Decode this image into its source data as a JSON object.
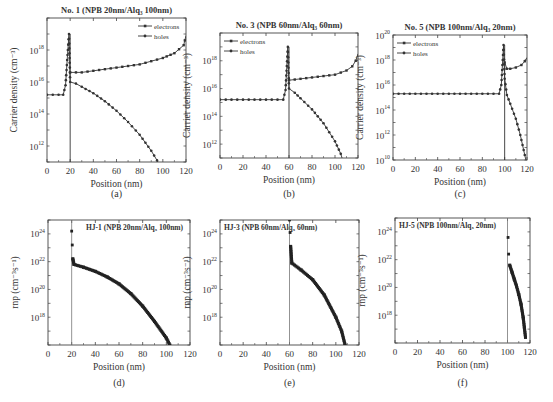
{
  "figure": {
    "panels": [
      {
        "id": "a",
        "caption": "(a)",
        "title": "No. 1 (NPB 20nm/Alq₃ 100nm)",
        "ylabel": "Carrier density (cm⁻³)",
        "xlabel": "Position (nm)"
      },
      {
        "id": "b",
        "caption": "(b)",
        "title": "No. 3 (NPB 60nm/Alq₃ 60nm)",
        "ylabel": "Carrier density (cm⁻³)",
        "xlabel": "Position (nm)"
      },
      {
        "id": "c",
        "caption": "(c)",
        "title": "No. 5 (NPB 100nm/Alq₃ 20nm)",
        "ylabel": "Carrier density (cm⁻³)",
        "xlabel": "Position (nm)"
      },
      {
        "id": "d",
        "caption": "(d)",
        "title": "HJ-1 (NPB 20nm/Alq₃ 100nm)",
        "ylabel": "rnp (cm⁻³s⁻¹)",
        "xlabel": "Position (nm)"
      },
      {
        "id": "e",
        "caption": "(e)",
        "title": "HJ-3 (NPB 60nm/Alq₃ 60nm)",
        "ylabel": "rnp (cm⁻³s⁻¹)",
        "xlabel": "Position (nm)"
      },
      {
        "id": "f",
        "caption": "(f)",
        "title": "HJ-5 (NPB 100nm/Alq₃ 20nm)",
        "ylabel": "rnp (cm⁻³s⁻¹)",
        "xlabel": "Position (nm)"
      }
    ],
    "legend": {
      "electrons": "electrons",
      "holes": "holes"
    }
  },
  "chart_data": [
    {
      "type": "line",
      "panel": "a",
      "title": "No. 1 (NPB 20nm/Alq3 100nm)",
      "xlabel": "Position (nm)",
      "ylabel": "Carrier density (cm^-3)",
      "yscale": "log",
      "xlim": [
        0,
        120
      ],
      "ylim": [
        100000000000.0,
        1e+20
      ],
      "xticks": [
        0,
        20,
        40,
        60,
        80,
        100,
        120
      ],
      "yticks": [
        "10^12",
        "10^14",
        "10^16",
        "10^18"
      ],
      "legend": [
        "electrons",
        "holes"
      ],
      "legend_position": "upper right",
      "series": [
        {
          "name": "electrons",
          "x": [
            20,
            30,
            40,
            50,
            60,
            70,
            80,
            90,
            100,
            110,
            118,
            120
          ],
          "log10_y": [
            16.6,
            16.6,
            16.7,
            16.8,
            16.9,
            17.0,
            17.1,
            17.3,
            17.5,
            17.8,
            18.3,
            18.9
          ]
        },
        {
          "name": "holes",
          "x": [
            0,
            5,
            10,
            14,
            16,
            18,
            19,
            20,
            25,
            30,
            40,
            50,
            60,
            70,
            80,
            90,
            95,
            100
          ],
          "log10_y": [
            15.2,
            15.2,
            15.2,
            15.2,
            15.8,
            18.0,
            19.0,
            16.0,
            15.9,
            15.7,
            15.3,
            14.8,
            14.2,
            13.5,
            12.7,
            11.7,
            11.1,
            10.5
          ]
        }
      ]
    },
    {
      "type": "line",
      "panel": "b",
      "title": "No. 3 (NPB 60nm/Alq3 60nm)",
      "xlabel": "Position (nm)",
      "ylabel": "Carrier density (cm^-3)",
      "yscale": "log",
      "xlim": [
        0,
        120
      ],
      "ylim": [
        100000000000.0,
        1e+20
      ],
      "xticks": [
        0,
        20,
        40,
        60,
        80,
        100,
        120
      ],
      "yticks": [
        "10^12",
        "10^14",
        "10^16",
        "10^18"
      ],
      "legend": [
        "electrons",
        "holes"
      ],
      "legend_position": "upper left",
      "series": [
        {
          "name": "electrons",
          "x": [
            60,
            70,
            80,
            90,
            100,
            110,
            115,
            118,
            120
          ],
          "log10_y": [
            16.6,
            16.7,
            16.8,
            16.9,
            17.0,
            17.3,
            17.6,
            18.0,
            18.5
          ]
        },
        {
          "name": "holes",
          "x": [
            0,
            10,
            20,
            30,
            40,
            50,
            55,
            57,
            59,
            60,
            65,
            70,
            80,
            90,
            100,
            105,
            108
          ],
          "log10_y": [
            15.2,
            15.2,
            15.2,
            15.2,
            15.2,
            15.2,
            15.2,
            15.9,
            19.0,
            16.0,
            15.7,
            15.3,
            14.5,
            13.5,
            12.2,
            11.3,
            10.5
          ]
        }
      ]
    },
    {
      "type": "line",
      "panel": "c",
      "title": "No. 5 (NPB 100nm/Alq3 20nm)",
      "xlabel": "Position (nm)",
      "ylabel": "Carrier density (cm^-3)",
      "yscale": "log",
      "xlim": [
        0,
        120
      ],
      "ylim": [
        10000000000.0,
        1e+20
      ],
      "xticks": [
        0,
        20,
        40,
        60,
        80,
        100,
        120
      ],
      "yticks": [
        "10^10",
        "10^12",
        "10^14",
        "10^16",
        "10^18",
        "10^20"
      ],
      "legend": [
        "electrons",
        "holes"
      ],
      "legend_position": "upper left",
      "series": [
        {
          "name": "electrons",
          "x": [
            100,
            102,
            105,
            110,
            115,
            118,
            120
          ],
          "log10_y": [
            17.8,
            17.3,
            17.3,
            17.4,
            17.6,
            17.9,
            18.2
          ]
        },
        {
          "name": "holes",
          "x": [
            0,
            20,
            40,
            60,
            80,
            95,
            97,
            99,
            100,
            102,
            105,
            110,
            114,
            117,
            119
          ],
          "log10_y": [
            15.3,
            15.3,
            15.3,
            15.3,
            15.3,
            15.3,
            16.0,
            19.2,
            16.5,
            15.2,
            14.5,
            13.3,
            12.0,
            10.8,
            10.0
          ]
        }
      ]
    },
    {
      "type": "scatter",
      "panel": "d",
      "title": "HJ-1 (NPB 20nm/Alq3 100nm)",
      "xlabel": "Position (nm)",
      "ylabel": "rnp (cm^-3 s^-1)",
      "yscale": "log",
      "xlim": [
        0,
        120
      ],
      "ylim": [
        1e+16,
        1e+25
      ],
      "xticks": [
        0,
        20,
        40,
        60,
        80,
        100,
        120
      ],
      "yticks": [
        "10^18",
        "10^20",
        "10^22",
        "10^24"
      ],
      "vline_x": 20,
      "series": [
        {
          "name": "rnp",
          "x": [
            20,
            20.5,
            21,
            22,
            30,
            40,
            50,
            60,
            70,
            80,
            90,
            100,
            103
          ],
          "log10_y": [
            24.2,
            23.2,
            22.2,
            21.8,
            21.6,
            21.3,
            20.9,
            20.4,
            19.7,
            18.8,
            17.7,
            16.5,
            16.0
          ]
        }
      ]
    },
    {
      "type": "scatter",
      "panel": "e",
      "title": "HJ-3 (NPB 60nm/Alq3 60nm)",
      "xlabel": "Position (nm)",
      "ylabel": "rnp (cm^-3 s^-1)",
      "yscale": "log",
      "xlim": [
        0,
        120
      ],
      "ylim": [
        1e+16,
        1e+25
      ],
      "xticks": [
        0,
        20,
        40,
        60,
        80,
        100,
        120
      ],
      "yticks": [
        "10^18",
        "10^20",
        "10^22",
        "10^24"
      ],
      "vline_x": 60,
      "series": [
        {
          "name": "rnp",
          "x": [
            60,
            60.5,
            61,
            62,
            70,
            80,
            90,
            100,
            105,
            108
          ],
          "log10_y": [
            25.0,
            24.1,
            23.1,
            21.9,
            21.4,
            20.7,
            19.6,
            18.0,
            17.0,
            16.0
          ]
        }
      ]
    },
    {
      "type": "scatter",
      "panel": "f",
      "title": "HJ-5 (NPB 100nm/Alq3 20nm)",
      "xlabel": "Position (nm)",
      "ylabel": "rnp (cm^-3 s^-1)",
      "yscale": "log",
      "xlim": [
        0,
        120
      ],
      "ylim": [
        1e+16,
        1e+25
      ],
      "xticks": [
        0,
        20,
        40,
        60,
        80,
        100,
        120
      ],
      "yticks": [
        "10^18",
        "10^20",
        "10^22",
        "10^24"
      ],
      "vline_x": 100,
      "series": [
        {
          "name": "rnp",
          "x": [
            100.5,
            101,
            102,
            104,
            106,
            108,
            110,
            112,
            114,
            115,
            116
          ],
          "log10_y": [
            23.6,
            22.4,
            21.6,
            21.1,
            20.6,
            20.1,
            19.5,
            18.8,
            17.8,
            17.1,
            16.4
          ]
        }
      ]
    }
  ]
}
